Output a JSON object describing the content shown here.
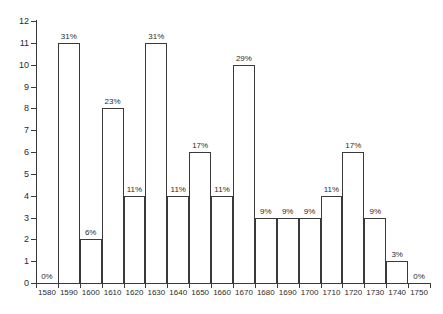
{
  "chart_data": {
    "type": "bar",
    "title": "",
    "subtitle": "",
    "xlabel": "",
    "ylabel": "",
    "grid": false,
    "legend": "none",
    "ylim": [
      0,
      12
    ],
    "ytick_labels": [
      "0",
      "1",
      "2",
      "3",
      "4",
      "5",
      "6",
      "7",
      "8",
      "9",
      "10",
      "11",
      "12"
    ],
    "ytick_values": [
      0,
      1,
      2,
      3,
      4,
      5,
      6,
      7,
      8,
      9,
      10,
      11,
      12
    ],
    "categories": [
      "1580",
      "1590",
      "1600",
      "1610",
      "1620",
      "1630",
      "1640",
      "1650",
      "1660",
      "1670",
      "1680",
      "1690",
      "1700",
      "1710",
      "1720",
      "1730",
      "1740",
      "1750"
    ],
    "values": [
      0,
      11,
      2,
      8,
      4,
      11,
      4,
      6,
      4,
      10,
      3,
      3,
      3,
      4,
      6,
      3,
      1,
      0
    ],
    "data_labels": [
      "0%",
      "31%",
      "6%",
      "23%",
      "11%",
      "31%",
      "11%",
      "17%",
      "11%",
      "29%",
      "9%",
      "9%",
      "9%",
      "11%",
      "17%",
      "9%",
      "3%",
      "0%"
    ],
    "colors": {
      "bar_fill": "#ffffff",
      "bar_stroke": "#3a3a3a",
      "axis": "#3a3a3a",
      "text": "#2b2b2b",
      "background": "#ffffff"
    }
  }
}
